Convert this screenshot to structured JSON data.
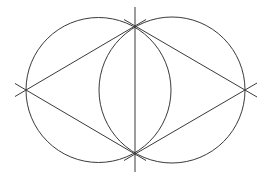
{
  "diagram": {
    "stroke_color": "#3a3a3a",
    "background_color": "#ffffff",
    "elements": [
      {
        "name": "left-circle",
        "type": "circle"
      },
      {
        "name": "right-circle",
        "type": "circle"
      },
      {
        "name": "vertical-axis-line",
        "type": "line"
      },
      {
        "name": "rhombus-edge-left-top",
        "type": "line"
      },
      {
        "name": "rhombus-edge-left-bottom",
        "type": "line"
      },
      {
        "name": "rhombus-edge-right-top",
        "type": "line"
      },
      {
        "name": "rhombus-edge-right-bottom",
        "type": "line"
      }
    ],
    "labels": []
  }
}
